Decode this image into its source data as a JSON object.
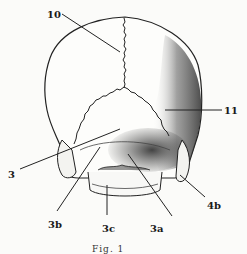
{
  "figure": {
    "labels": [
      {
        "id": "10",
        "text": "10"
      },
      {
        "id": "11",
        "text": "11"
      },
      {
        "id": "3",
        "text": "3"
      },
      {
        "id": "3a",
        "text": "3a"
      },
      {
        "id": "3b",
        "text": "3b"
      },
      {
        "id": "3c",
        "text": "3c"
      },
      {
        "id": "4b",
        "text": "4b"
      }
    ],
    "caption": "Fig. 1"
  }
}
